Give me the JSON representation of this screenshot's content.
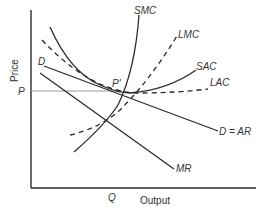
{
  "diagram": {
    "type": "economics-cost-revenue",
    "axes": {
      "y_label": "Price",
      "x_label": "Output",
      "y_tick": "P",
      "x_tick": "Q"
    },
    "point_label": "P'",
    "curves": [
      {
        "id": "smc",
        "label": "SMC",
        "style": "solid"
      },
      {
        "id": "lmc",
        "label": "LMC",
        "style": "dashed"
      },
      {
        "id": "sac",
        "label": "SAC",
        "style": "solid"
      },
      {
        "id": "lac",
        "label": "LAC",
        "style": "dashed"
      },
      {
        "id": "demand",
        "label": "D = AR",
        "start_label": "D",
        "style": "solid"
      },
      {
        "id": "mr",
        "label": "MR",
        "style": "solid"
      }
    ],
    "colors": {
      "line": "#2a2a2a",
      "price_line": "#9a9a9a",
      "text": "#333333"
    }
  }
}
